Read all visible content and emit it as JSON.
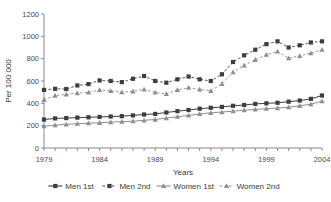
{
  "chart_data": {
    "type": "line",
    "title": "",
    "xlabel": "Years",
    "ylabel": "Per 100 000",
    "xlim": [
      1979,
      2004
    ],
    "ylim": [
      0,
      1200
    ],
    "ytick_step": 200,
    "yticks": [
      0,
      200,
      400,
      600,
      800,
      1000,
      1200
    ],
    "xticks_labeled": [
      1979,
      1984,
      1989,
      1994,
      1999,
      2004
    ],
    "x": [
      1979,
      1980,
      1981,
      1982,
      1983,
      1984,
      1985,
      1986,
      1987,
      1988,
      1989,
      1990,
      1991,
      1992,
      1993,
      1994,
      1995,
      1996,
      1997,
      1998,
      1999,
      2000,
      2001,
      2002,
      2003,
      2004
    ],
    "grid": false,
    "legend_position": "bottom",
    "series": [
      {
        "name": "Men 1st",
        "marker": "square",
        "linestyle": "solid",
        "color": "#3d3d3d",
        "values": [
          255,
          265,
          268,
          272,
          275,
          278,
          282,
          285,
          292,
          300,
          305,
          318,
          330,
          340,
          352,
          360,
          368,
          378,
          385,
          395,
          400,
          405,
          415,
          425,
          440,
          470
        ]
      },
      {
        "name": "Men 2nd",
        "marker": "square",
        "linestyle": "dashed",
        "color": "#3d3d3d",
        "values": [
          520,
          530,
          528,
          560,
          572,
          605,
          600,
          590,
          620,
          645,
          600,
          585,
          615,
          640,
          615,
          600,
          660,
          770,
          830,
          880,
          930,
          955,
          900,
          920,
          945,
          955
        ]
      },
      {
        "name": "Women 1st",
        "marker": "triangle",
        "linestyle": "solid",
        "color": "#8f8f8f",
        "values": [
          195,
          205,
          212,
          218,
          222,
          226,
          232,
          236,
          240,
          248,
          255,
          268,
          280,
          292,
          305,
          315,
          322,
          330,
          338,
          345,
          352,
          358,
          365,
          378,
          392,
          420
        ]
      },
      {
        "name": "Women 2nd",
        "marker": "triangle",
        "linestyle": "dashed",
        "color": "#8f8f8f",
        "values": [
          430,
          470,
          480,
          492,
          498,
          520,
          512,
          500,
          508,
          525,
          498,
          485,
          520,
          540,
          525,
          512,
          575,
          680,
          740,
          790,
          835,
          865,
          805,
          825,
          850,
          880
        ]
      }
    ]
  },
  "legend": {
    "items": [
      {
        "label": "Men 1st"
      },
      {
        "label": "Men 2nd"
      },
      {
        "label": "Women 1st"
      },
      {
        "label": "Women 2nd"
      }
    ]
  }
}
